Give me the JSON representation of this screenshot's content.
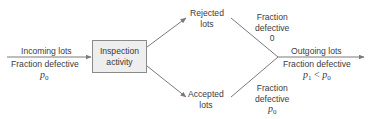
{
  "diagram": {
    "incoming": {
      "label": "Incoming lots",
      "fraction_label": "Fraction defective",
      "symbol": "p",
      "symbol_sub": "0"
    },
    "inspection": {
      "line1": "Inspection",
      "line2": "activity"
    },
    "rejected": {
      "line1": "Rejected",
      "line2": "lots",
      "fraction_line1": "Fraction",
      "fraction_line2": "defective",
      "fraction_value": "0"
    },
    "accepted": {
      "line1": "Accepted",
      "line2": "lots",
      "fraction_line1": "Fraction",
      "fraction_line2": "defective",
      "symbol": "p",
      "symbol_sub": "0"
    },
    "outgoing": {
      "label": "Outgoing lots",
      "fraction_label": "Fraction defective",
      "lhs": "p",
      "lhs_sub": "1",
      "op": " < ",
      "rhs": "p",
      "rhs_sub": "0"
    },
    "line_color": "#7a7a7a",
    "box_fill": "#eeeeee"
  }
}
